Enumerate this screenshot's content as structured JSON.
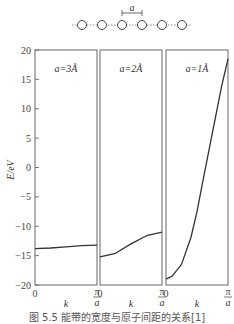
{
  "chart_data": {
    "type": "line",
    "ylabel": "E/eV",
    "ylim": [
      -20,
      20
    ],
    "yticks": [
      20,
      15,
      10,
      5,
      0,
      -5,
      -10,
      -15,
      -20
    ],
    "xlabel": "k",
    "x_tick_labels": [
      "0",
      "π/a"
    ],
    "inset": {
      "description": "chain of atoms with spacing",
      "spacing_label": "a",
      "atom_count": 6
    },
    "panels": [
      {
        "label": "a=3Å",
        "x": [
          0,
          0.25,
          0.5,
          0.75,
          1.0
        ],
        "y": [
          -13.8,
          -13.7,
          -13.5,
          -13.3,
          -13.2
        ]
      },
      {
        "label": "a=2Å",
        "x": [
          0,
          0.25,
          0.5,
          0.75,
          1.0
        ],
        "y": [
          -15.2,
          -14.6,
          -13.0,
          -11.6,
          -11.0
        ]
      },
      {
        "label": "a=1Å",
        "x": [
          0,
          0.1,
          0.25,
          0.4,
          0.5,
          0.6,
          0.75,
          0.9,
          1.0
        ],
        "y": [
          -19.0,
          -18.5,
          -16.5,
          -12.0,
          -7.5,
          -2.0,
          6.0,
          14.0,
          18.5
        ]
      }
    ],
    "caption": "图 5.5   能带的宽度与原子间距的关系[1]"
  }
}
